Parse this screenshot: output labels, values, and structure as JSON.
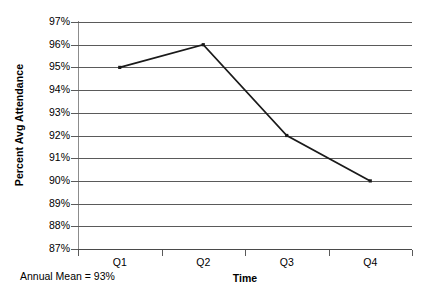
{
  "chart_data": {
    "type": "line",
    "title": "",
    "xlabel": "Time",
    "ylabel": "Percent Avg Attendance",
    "categories": [
      "Q1",
      "Q2",
      "Q3",
      "Q4"
    ],
    "values": [
      95,
      96,
      92,
      90
    ],
    "value_labels": [
      "95%",
      "96%",
      "92%",
      "90%"
    ],
    "ylim": [
      87,
      97
    ],
    "ytick_labels": [
      "97%",
      "96%",
      "95%",
      "94%",
      "93%",
      "92%",
      "91%",
      "90%",
      "89%",
      "88%",
      "87%"
    ],
    "ytick_values": [
      97,
      96,
      95,
      94,
      93,
      92,
      91,
      90,
      89,
      88,
      87
    ],
    "grid": "horizontal",
    "legend": "none",
    "series": [
      {
        "name": "Percent Avg Attendance",
        "values": [
          95,
          96,
          92,
          90
        ],
        "color": "#1a1a1a",
        "marker": "square"
      }
    ],
    "annotations": [
      {
        "name": "annual-mean",
        "text": "Annual Mean = 93%",
        "value": 93
      }
    ]
  },
  "colors": {
    "line": "#1a1a1a",
    "gridline": "#5a5a5a",
    "axis": "#8c8c8c",
    "text": "#000000",
    "background": "#ffffff"
  },
  "footnote": {
    "text": "Annual Mean = 93%"
  }
}
